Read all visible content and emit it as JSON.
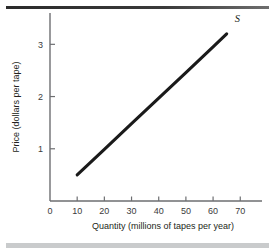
{
  "figure": {
    "name": "supply-curve-figure",
    "top_rule_color": "#2b2b2b",
    "bottom_rule_color": "#c9cbcc",
    "line_color": "#1a1a1a",
    "axis_color": "#6d6e71"
  },
  "chart_data": {
    "type": "line",
    "title": "",
    "subtitle": "",
    "xlabel": "Quantity (millions of tapes per year)",
    "ylabel": "Price (dollars per tape)",
    "xlim": [
      0,
      78
    ],
    "ylim": [
      0,
      3.6
    ],
    "grid": false,
    "legend_position": "none",
    "x_ticks": [
      0,
      10,
      20,
      30,
      40,
      50,
      60,
      70
    ],
    "x_tick_labels": [
      "0",
      "10",
      "20",
      "30",
      "40",
      "50",
      "60",
      "70"
    ],
    "y_ticks": [
      1,
      2,
      3
    ],
    "y_tick_labels": [
      "1",
      "2",
      "3"
    ],
    "series": [
      {
        "name": "S",
        "label": "S",
        "label_style": "italic",
        "x": [
          10,
          65
        ],
        "y": [
          0.5,
          3.2
        ],
        "points": [
          {
            "x": 10,
            "y": 0.5
          },
          {
            "x": 20,
            "y": 0.99
          },
          {
            "x": 30,
            "y": 1.48
          },
          {
            "x": 40,
            "y": 1.97
          },
          {
            "x": 50,
            "y": 2.46
          },
          {
            "x": 60,
            "y": 2.95
          },
          {
            "x": 65,
            "y": 3.2
          }
        ]
      }
    ],
    "annotations": [
      {
        "text": "S",
        "x": 68,
        "y": 3.42
      }
    ]
  }
}
